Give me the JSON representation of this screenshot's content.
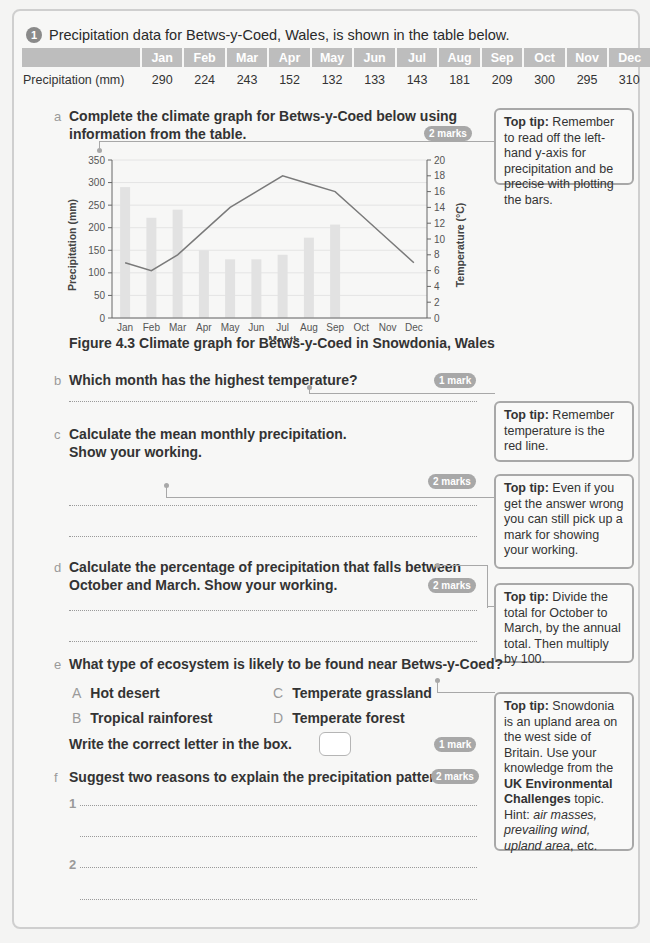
{
  "question": {
    "number": "1",
    "intro": "Precipitation data for Betws-y-Coed, Wales, is shown in the table below."
  },
  "table": {
    "row_label": "Precipitation (mm)",
    "months": [
      "Jan",
      "Feb",
      "Mar",
      "Apr",
      "May",
      "Jun",
      "Jul",
      "Aug",
      "Sep",
      "Oct",
      "Nov",
      "Dec"
    ],
    "values": [
      "290",
      "224",
      "243",
      "152",
      "132",
      "133",
      "143",
      "181",
      "209",
      "300",
      "295",
      "310"
    ]
  },
  "parts": {
    "a": {
      "letter": "a",
      "line1": "Complete the climate graph for Betws-y-Coed below using",
      "line2": "information from the table.",
      "marks": "2 marks"
    },
    "b": {
      "letter": "b",
      "text": "Which month has the highest temperature?",
      "marks": "1 mark"
    },
    "c": {
      "letter": "c",
      "line1": "Calculate the mean monthly precipitation.",
      "line2": "Show your working.",
      "marks": "2 marks"
    },
    "d": {
      "letter": "d",
      "line1": "Calculate the percentage of precipitation that falls between",
      "line2": "October and March. Show your working.",
      "marks": "2 marks"
    },
    "e": {
      "letter": "e",
      "text": "What type of ecosystem is likely to be found near Betws-y-Coed?",
      "options": [
        {
          "letter": "A",
          "label": "Hot desert"
        },
        {
          "letter": "B",
          "label": "Tropical rainforest"
        },
        {
          "letter": "C",
          "label": "Temperate grassland"
        },
        {
          "letter": "D",
          "label": "Temperate forest"
        }
      ],
      "instruction": "Write the correct letter in the box.",
      "marks": "1 mark"
    },
    "f": {
      "letter": "f",
      "text_pre": "Suggest ",
      "text_bold": "two",
      "text_post": " reasons to explain the precipitation pattern.",
      "marks": "2 marks",
      "answer_labels": [
        "1",
        "2"
      ]
    }
  },
  "figure_caption": "Figure 4.3 Climate graph for Betws-y-Coed in Snowdonia, Wales",
  "tips": {
    "a": {
      "label": "Top tip:",
      "text": " Remember to read off the left-hand y-axis for precipitation and be precise with plotting the bars."
    },
    "b": {
      "label": "Top tip:",
      "text": " Remember temperature is the red line."
    },
    "c": {
      "label": "Top tip:",
      "text": " Even if you get the answer wrong you can still pick up a mark for showing your working."
    },
    "d": {
      "label": "Top tip:",
      "text": " Divide the total for October to March, by the annual total. Then multiply by 100."
    },
    "e": {
      "label": "Top tip:",
      "text1": " Snowdonia is an upland area on the west side of Britain. Use your knowledge from the ",
      "bold": "UK Environmental Challenges",
      "text2": " topic. Hint: ",
      "italic1": "air masses, prevailing wind, upland area",
      "text3": ", etc."
    }
  },
  "chart_data": {
    "type": "bar+line",
    "title": "Figure 4.3 Climate graph for Betws-y-Coed in Snowdonia, Wales",
    "categories": [
      "Jan",
      "Feb",
      "Mar",
      "Apr",
      "May",
      "Jun",
      "Jul",
      "Aug",
      "Sep",
      "Oct",
      "Nov",
      "Dec"
    ],
    "series": [
      {
        "name": "Precipitation (mm)",
        "type": "bar",
        "axis": "left",
        "values": [
          290,
          222,
          240,
          150,
          130,
          130,
          140,
          178,
          207,
          null,
          null,
          null
        ]
      },
      {
        "name": "Temperature (°C)",
        "type": "line",
        "axis": "right",
        "values": [
          7,
          6,
          8,
          11,
          14,
          16,
          18,
          17,
          16,
          13,
          10,
          7
        ]
      }
    ],
    "xlabel": "Month",
    "ylabel": "Precipitation (mm)",
    "ylabel_right": "Temperature (°C)",
    "ylim": [
      0,
      350
    ],
    "yticks": [
      0,
      50,
      100,
      150,
      200,
      250,
      300,
      350
    ],
    "ylim_right": [
      0,
      20
    ],
    "yticks_right": [
      0,
      2,
      4,
      6,
      8,
      10,
      12,
      14,
      16,
      18,
      20
    ],
    "grid": true,
    "bar_color": "#e2e2e2",
    "line_color": "#7a7a7a"
  }
}
